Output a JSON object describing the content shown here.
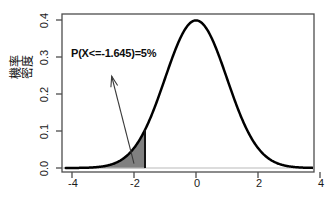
{
  "figure": {
    "background_color": "#ffffff",
    "axis_color": "#4d4d4d",
    "curve_color": "#000000",
    "shade_color": "#808080",
    "arrow_color": "#3a3a3a"
  },
  "axes": {
    "y_title": "機率密度",
    "x_ticks": [
      "-4",
      "-2",
      "0",
      "2",
      "4"
    ],
    "y_ticks": [
      "0.0",
      "0.1",
      "0.2",
      "0.3",
      "0.4"
    ]
  },
  "annotation": {
    "text": "P(X<=-1.645)=5%",
    "arrow_tail_x": -2.0,
    "arrow_tail_y": 0.012,
    "arrow_head_x": -2.72,
    "arrow_head_y": 0.248
  },
  "chart_data": {
    "type": "line",
    "title": "",
    "xlabel": "",
    "ylabel": "機率密度",
    "xlim": [
      -4.2,
      4.2
    ],
    "ylim": [
      0.0,
      0.42
    ],
    "grid": false,
    "legend": "none",
    "distribution": "standard normal (mean 0, sd 1)",
    "x": [
      -4.2,
      -4.0,
      -3.8,
      -3.6,
      -3.4,
      -3.2,
      -3.0,
      -2.8,
      -2.6,
      -2.4,
      -2.2,
      -2.0,
      -1.8,
      -1.645,
      -1.6,
      -1.4,
      -1.2,
      -1.0,
      -0.8,
      -0.6,
      -0.4,
      -0.2,
      0.0,
      0.2,
      0.4,
      0.6,
      0.8,
      1.0,
      1.2,
      1.4,
      1.6,
      1.8,
      2.0,
      2.2,
      2.4,
      2.6,
      2.8,
      3.0,
      3.2,
      3.4,
      3.6,
      3.8,
      4.0,
      4.2
    ],
    "y": [
      0.0001,
      0.0001,
      0.0003,
      0.0006,
      0.0012,
      0.0024,
      0.0044,
      0.0079,
      0.0136,
      0.0224,
      0.0355,
      0.054,
      0.079,
      0.1031,
      0.1109,
      0.1497,
      0.1942,
      0.242,
      0.2897,
      0.3332,
      0.3683,
      0.391,
      0.3989,
      0.391,
      0.3683,
      0.3332,
      0.2897,
      0.242,
      0.1942,
      0.1497,
      0.1109,
      0.079,
      0.054,
      0.0355,
      0.0224,
      0.0136,
      0.0079,
      0.0044,
      0.0024,
      0.0012,
      0.0006,
      0.0003,
      0.0001,
      0.0001
    ],
    "shaded_region": {
      "label": "lower 5% tail",
      "from": -4.2,
      "to": -1.645,
      "area": 0.05,
      "color": "#808080"
    },
    "peak": {
      "x": 0.0,
      "y": 0.3989
    },
    "critical_value": -1.645
  }
}
